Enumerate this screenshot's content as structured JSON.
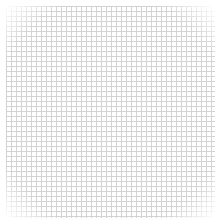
{
  "image": {
    "description": "graph paper grid texture",
    "background_color": "#ffffff",
    "line_color": "#cfcfcf",
    "grid_spacing_px": 5
  }
}
